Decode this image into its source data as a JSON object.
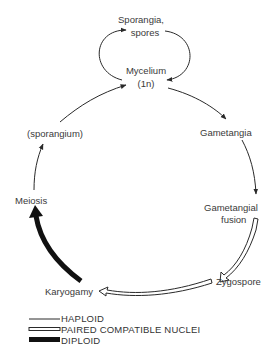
{
  "diagram": {
    "nodes": {
      "sporangia": "Sporangia,",
      "spores": "spores",
      "mycelium": "Mycelium",
      "mycelium_ploidy": "(1n)",
      "gametangia": "Gametangia",
      "gametangial": "Gametangial",
      "fusion": "fusion",
      "zygospore": "Zygospore",
      "karyogamy": "Karyogamy",
      "meiosis": "Meiosis",
      "sporangium": "(sporangium)"
    },
    "legend": {
      "haploid": "HAPLOID",
      "paired": "PAIRED COMPATIBLE NUCLEI",
      "diploid": "DIPLOID"
    },
    "colors": {
      "line": "#2a2a2a",
      "diploid": "#111111"
    }
  }
}
